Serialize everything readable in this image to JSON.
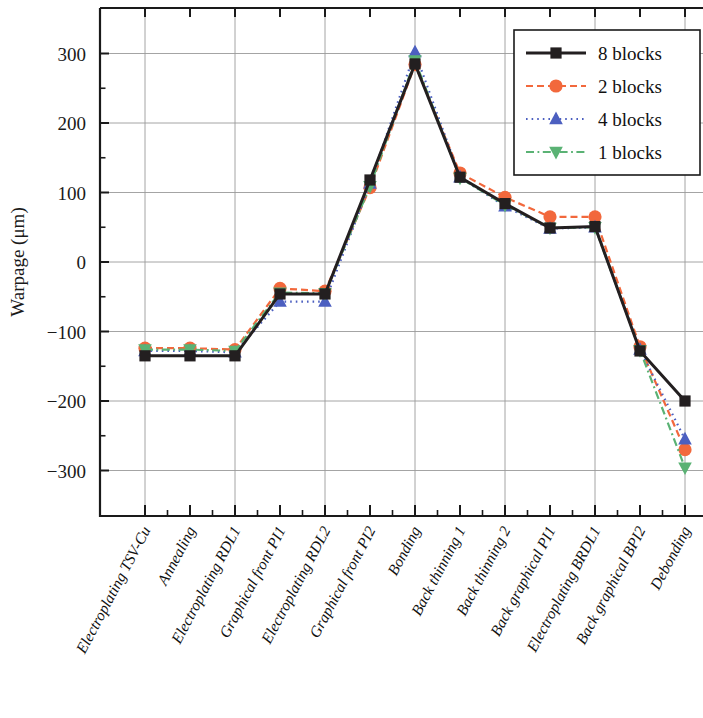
{
  "chart_data": {
    "type": "line",
    "title": "",
    "xlabel": "",
    "ylabel": "Warpage (μm)",
    "ylim": [
      -340,
      345
    ],
    "yticks": [
      300,
      200,
      100,
      0,
      -100,
      -200,
      -300
    ],
    "ytick_labels": [
      "300",
      "200",
      "100",
      "0",
      "−100",
      "−200",
      "−300"
    ],
    "yminor_step": 50,
    "grid": true,
    "grid_axis": "both",
    "legend_position": "top-right",
    "categories": [
      "Electroplating TSV-Cu",
      "Annealing",
      "Electroplating RDL1",
      "Graphical front PI1",
      "Electroplating RDL2",
      "Graphical front PI2",
      "Bonding",
      "Back thinning 1",
      "Back thinning 2",
      "Back graphical PI1",
      "Electroplating BRDL1",
      "Back graphical BPI2",
      "Debonding"
    ],
    "series": [
      {
        "name": "8 blocks",
        "color": "#231f20",
        "marker": "square",
        "dash": "solid",
        "values": [
          -135,
          -135,
          -135,
          -46,
          -46,
          118,
          285,
          122,
          84,
          49,
          51,
          -128,
          -200
        ]
      },
      {
        "name": "2 blocks",
        "color": "#f2683c",
        "marker": "circle",
        "dash": "dashed",
        "values": [
          -124,
          -124,
          -126,
          -38,
          -42,
          107,
          284,
          128,
          93,
          65,
          65,
          -122,
          -270
        ]
      },
      {
        "name": "4 blocks",
        "color": "#4c5fc0",
        "marker": "triangle-up",
        "dash": "dotted",
        "values": [
          -128,
          -128,
          -130,
          -57,
          -57,
          113,
          302,
          122,
          80,
          48,
          50,
          -126,
          -255
        ]
      },
      {
        "name": "1 blocks",
        "color": "#5ab274",
        "marker": "triangle-down",
        "dash": "dashdot",
        "values": [
          -126,
          -126,
          -128,
          -44,
          -45,
          109,
          290,
          121,
          82,
          49,
          50,
          -127,
          -296
        ]
      }
    ]
  },
  "legend": {
    "entries": [
      {
        "label": "8 blocks"
      },
      {
        "label": "2 blocks"
      },
      {
        "label": "4 blocks"
      },
      {
        "label": "1 blocks"
      }
    ]
  }
}
